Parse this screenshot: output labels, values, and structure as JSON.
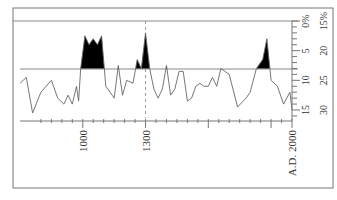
{
  "chart_data": {
    "type": "area",
    "title": "",
    "orientation": "rotated-90",
    "xlabel": "",
    "x_ticks": [
      "1000",
      "1300",
      "A.D. 2000"
    ],
    "x_tick_values": [
      1000,
      1300,
      2000
    ],
    "xlim": [
      700,
      2000
    ],
    "y_left_scale": {
      "labels": [
        "0%",
        "5",
        "10",
        "15"
      ],
      "values": [
        0,
        5,
        10,
        15
      ]
    },
    "y_right_scale": {
      "labels": [
        "15%",
        "20",
        "25",
        "30"
      ],
      "values": [
        15,
        20,
        25,
        30
      ]
    },
    "baseline": 8,
    "reference_year": 1300,
    "series": [
      {
        "name": "record",
        "x": [
          700,
          730,
          760,
          800,
          850,
          880,
          910,
          930,
          950,
          970,
          980,
          990,
          1010,
          1030,
          1050,
          1070,
          1090,
          1110,
          1130,
          1150,
          1170,
          1190,
          1210,
          1240,
          1260,
          1280,
          1300,
          1320,
          1340,
          1360,
          1380,
          1400,
          1420,
          1440,
          1460,
          1480,
          1500,
          1520,
          1540,
          1560,
          1580,
          1600,
          1620,
          1640,
          1660,
          1700,
          1740,
          1780,
          1800,
          1830,
          1860,
          1880,
          1900,
          1930,
          1960,
          1990,
          2000
        ],
        "values": [
          10.5,
          9.5,
          15.5,
          12,
          10,
          13,
          14,
          12.5,
          14,
          11,
          13.5,
          8,
          2.5,
          4,
          3,
          4,
          2.5,
          11,
          12,
          13,
          7.5,
          12.5,
          10,
          10.5,
          6.5,
          8,
          2,
          8,
          11.5,
          13,
          11.5,
          7.5,
          12.5,
          11.5,
          8.5,
          8.5,
          13.5,
          13,
          11,
          10.5,
          11,
          11,
          9.5,
          11,
          8,
          9,
          14.5,
          13,
          12,
          8,
          6.5,
          3,
          10,
          11,
          14,
          12,
          15
        ]
      }
    ]
  }
}
